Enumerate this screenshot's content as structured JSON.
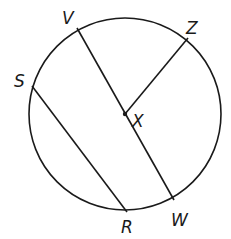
{
  "diagram": {
    "type": "circle-geometry",
    "stroke_color": "#1a1a1a",
    "background": "#ffffff",
    "circle": {
      "center": "X",
      "cx": 125,
      "cy": 114,
      "r": 96
    },
    "points": [
      {
        "name": "V",
        "x": 77,
        "y": 28,
        "label_x": 62,
        "label_y": 24
      },
      {
        "name": "Z",
        "x": 188,
        "y": 38,
        "label_x": 186,
        "label_y": 34
      },
      {
        "name": "S",
        "x": 32,
        "y": 86,
        "label_x": 14,
        "label_y": 87
      },
      {
        "name": "X",
        "x": 125,
        "y": 114,
        "label_x": 132,
        "label_y": 127
      },
      {
        "name": "R",
        "x": 127,
        "y": 212,
        "label_x": 121,
        "label_y": 233
      },
      {
        "name": "W",
        "x": 174,
        "y": 200,
        "label_x": 171,
        "label_y": 226
      }
    ],
    "segments": [
      {
        "name": "diameter-VW",
        "from": "V",
        "to": "W"
      },
      {
        "name": "radius-XZ",
        "from": "X",
        "to": "Z"
      },
      {
        "name": "chord-SR",
        "from": "S",
        "to": "R"
      }
    ],
    "labels": {
      "V": "V",
      "Z": "Z",
      "S": "S",
      "X": "X",
      "R": "R",
      "W": "W"
    }
  }
}
